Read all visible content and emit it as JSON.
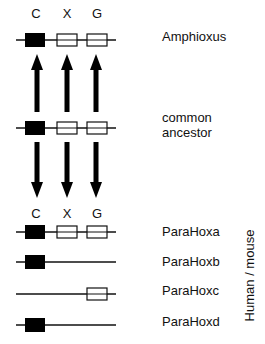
{
  "diagram": {
    "gene_columns": [
      "C",
      "X",
      "G"
    ],
    "rows": [
      {
        "id": "amphioxus",
        "label": "Amphioxus",
        "genes": {
          "C": "filled",
          "X": "open",
          "G": "open"
        },
        "show_gene_labels": true
      },
      {
        "id": "common-ancestor",
        "label_lines": [
          "common",
          "ancestor"
        ],
        "genes": {
          "C": "filled",
          "X": "open",
          "G": "open"
        }
      },
      {
        "id": "parahoxa",
        "label": "ParaHoxa",
        "genes": {
          "C": "filled",
          "X": "open",
          "G": "open"
        },
        "show_gene_labels": true
      },
      {
        "id": "parahoxb",
        "label": "ParaHoxb",
        "genes": {
          "C": "filled",
          "X": null,
          "G": null
        }
      },
      {
        "id": "parahoxc",
        "label": "ParaHoxc",
        "genes": {
          "C": null,
          "X": null,
          "G": "open"
        }
      },
      {
        "id": "parahoxd",
        "label": "ParaHoxd",
        "genes": {
          "C": "filled",
          "X": null,
          "G": null
        }
      }
    ],
    "arrows": [
      {
        "from": "common-ancestor",
        "to": "amphioxus",
        "direction": "up",
        "columns": [
          "C",
          "X",
          "G"
        ]
      },
      {
        "from": "common-ancestor",
        "to": "parahoxa",
        "direction": "down",
        "columns": [
          "C",
          "X",
          "G"
        ]
      }
    ],
    "group_label": "Human / mouse",
    "colors": {
      "filled": "#000000",
      "open": "#ffffff",
      "line": "#111111"
    }
  }
}
